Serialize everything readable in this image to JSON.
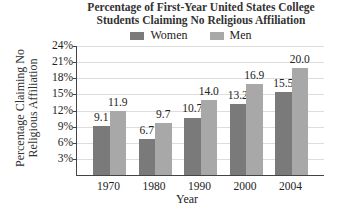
{
  "chart_data": {
    "type": "bar",
    "title": "Percentage of First-Year United States College Students Claiming No Religious Affiliation",
    "title_lines": [
      "Percentage of First-Year United States College",
      "Students Claiming No Religious Affiliation"
    ],
    "xlabel": "Year",
    "ylabel": "Percentage Claiming No Religious Affiliation",
    "ylabel_lines": [
      "Percentage Claiming No",
      "Religious Affiliation"
    ],
    "categories": [
      "1970",
      "1980",
      "1990",
      "2000",
      "2004"
    ],
    "series": [
      {
        "name": "Women",
        "values": [
          9.1,
          6.7,
          10.7,
          13.2,
          15.5
        ],
        "labels": [
          "9.1",
          "6.7",
          "10.7",
          "13.2",
          "15.5"
        ],
        "color": "#7a7a7a"
      },
      {
        "name": "Men",
        "values": [
          11.9,
          9.7,
          14.0,
          16.9,
          20.0
        ],
        "labels": [
          "11.9",
          "9.7",
          "14.0",
          "16.9",
          "20.0"
        ],
        "color": "#a8a8a8"
      }
    ],
    "yticks": [
      "3%",
      "6%",
      "9%",
      "12%",
      "15%",
      "18%",
      "21%",
      "24%"
    ],
    "ylim": [
      0,
      24
    ],
    "grid": true,
    "legend_position": "top"
  }
}
